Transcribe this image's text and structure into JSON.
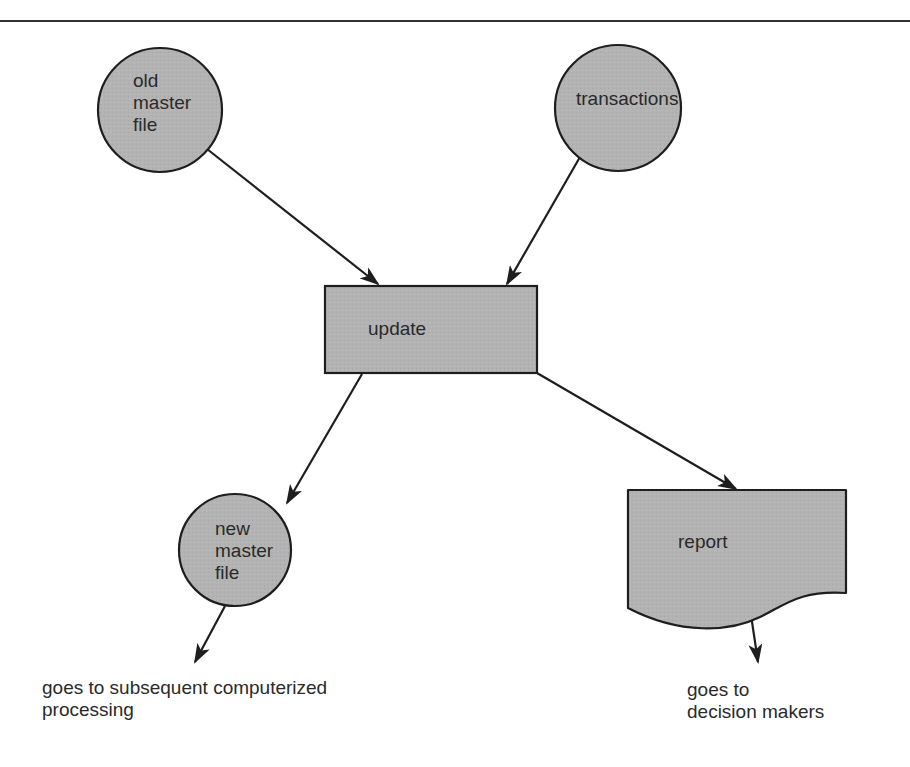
{
  "diagram": {
    "type": "data-flow",
    "colors": {
      "fill": "#b3b3b3",
      "stroke": "#1e1e1e",
      "text": "#2a2a2a",
      "rule": "#333333"
    },
    "nodes": {
      "old_master": {
        "shape": "circle",
        "label": "old\nmaster\nfile"
      },
      "transactions": {
        "shape": "circle",
        "label": "transactions"
      },
      "update": {
        "shape": "process-rectangle",
        "label": "update"
      },
      "new_master": {
        "shape": "circle",
        "label": "new\nmaster\nfile"
      },
      "report": {
        "shape": "document",
        "label": "report"
      }
    },
    "edges": [
      {
        "from": "old master file",
        "to": "update"
      },
      {
        "from": "transactions",
        "to": "update"
      },
      {
        "from": "update",
        "to": "new master file"
      },
      {
        "from": "update",
        "to": "report"
      },
      {
        "from": "new master file",
        "to": "goes to subsequent computerized processing"
      },
      {
        "from": "report",
        "to": "goes to decision makers"
      }
    ],
    "captions": {
      "new_master_output": "goes to subsequent computerized\nprocessing",
      "report_output": "goes to\ndecision makers"
    }
  }
}
